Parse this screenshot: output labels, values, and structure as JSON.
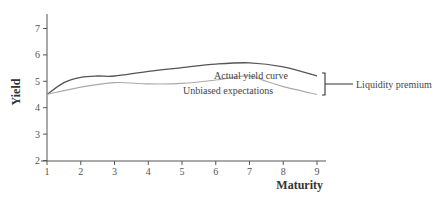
{
  "chart_data": {
    "type": "line",
    "title": "",
    "xlabel": "Maturity",
    "ylabel": "Yield",
    "xlim": [
      1,
      9
    ],
    "ylim": [
      2,
      7.5
    ],
    "x_ticks": [
      "1",
      "2",
      "3",
      "4",
      "5",
      "6",
      "7",
      "8",
      "9"
    ],
    "y_ticks": [
      "2",
      "3",
      "4",
      "5",
      "6",
      "7"
    ],
    "grid": false,
    "series": [
      {
        "name": "Actual yield curve",
        "color": "#555555",
        "x": [
          1,
          1.5,
          2,
          2.5,
          3,
          4,
          5,
          6,
          7,
          8,
          9
        ],
        "values": [
          4.5,
          4.95,
          5.15,
          5.2,
          5.2,
          5.38,
          5.52,
          5.65,
          5.7,
          5.55,
          5.2
        ]
      },
      {
        "name": "Unbiased expectations",
        "color": "#aaaaaa",
        "x": [
          1,
          2,
          3,
          4,
          5,
          6,
          6.5,
          7,
          7.5,
          8,
          9
        ],
        "values": [
          4.5,
          4.78,
          4.95,
          4.9,
          4.92,
          5.05,
          5.15,
          5.2,
          5.0,
          4.8,
          4.5
        ]
      }
    ],
    "annotations": [
      {
        "text": "Actual yield curve",
        "x": 6.3,
        "y": 6.0
      },
      {
        "text": "Unbiased expectations",
        "x": 5.6,
        "y": 4.65
      },
      {
        "text": "Liquidity premium",
        "bracket_at_x": 9,
        "from": 4.5,
        "to": 5.2
      }
    ]
  }
}
